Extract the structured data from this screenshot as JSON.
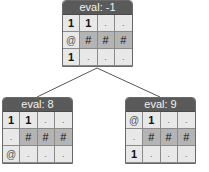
{
  "nodes": {
    "root": {
      "header": "eval: -1",
      "rows": [
        [
          "1",
          "1",
          ".",
          "."
        ],
        [
          "@",
          "#",
          "#",
          "#"
        ],
        [
          "1",
          ".",
          ".",
          "."
        ]
      ]
    },
    "left": {
      "header": "eval: 8",
      "rows": [
        [
          "1",
          "1",
          ".",
          "."
        ],
        [
          ".",
          "#",
          "#",
          "#"
        ],
        [
          "@",
          ".",
          ".",
          "."
        ]
      ]
    },
    "right": {
      "header": "eval: 9",
      "rows": [
        [
          "@",
          "1",
          ".",
          "."
        ],
        [
          ".",
          "#",
          "#",
          "#"
        ],
        [
          "1",
          ".",
          ".",
          "."
        ]
      ]
    }
  },
  "colors": {
    "header_bg": "#5a5a5a",
    "cell_bg": "#e8e8e8",
    "wall_bg": "#b4b4b4",
    "edge": "#555555"
  }
}
